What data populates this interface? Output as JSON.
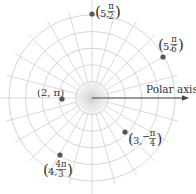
{
  "diagram": {
    "type": "polar-grid",
    "axis_label": "Polar axis",
    "grid": {
      "circles": [
        1,
        2,
        3,
        4,
        5
      ],
      "angle_step_deg": 15
    },
    "colors": {
      "grid": "#d0d0d0",
      "axis": "#444444",
      "point": "#555555",
      "text": "#333333"
    },
    "points": [
      {
        "r": 5,
        "theta_label": "π/2",
        "label": "(5, π/2)",
        "num": "π",
        "den": "2",
        "neg": false
      },
      {
        "r": 5,
        "theta_label": "π/6",
        "label": "(5, π/6)",
        "num": "π",
        "den": "6",
        "neg": false
      },
      {
        "r": 2,
        "theta_label": "π",
        "label": "(2, π)",
        "inline": "π"
      },
      {
        "r": 3,
        "theta_label": "-π/4",
        "label": "(3, −π/4)",
        "num": "π",
        "den": "4",
        "neg": true
      },
      {
        "r": 4,
        "theta_label": "4π/3",
        "label": "(4, 4π/3)",
        "num": "4π",
        "den": "3",
        "neg": false
      }
    ]
  }
}
